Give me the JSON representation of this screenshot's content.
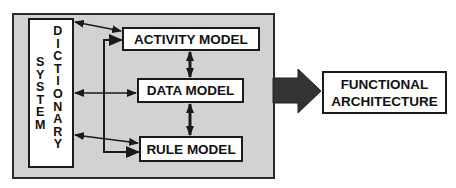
{
  "diagram": {
    "container": {
      "fill": "#d2d2d2",
      "border": "#2a2a2a"
    },
    "system_dictionary": {
      "word1": [
        "S",
        "Y",
        "S",
        "T",
        "E",
        "M"
      ],
      "word2": [
        "D",
        "I",
        "C",
        "T",
        "I",
        "O",
        "N",
        "A",
        "R",
        "Y"
      ],
      "label": "SYSTEM DICTIONARY"
    },
    "models": {
      "activity": "ACTIVITY MODEL",
      "data": "DATA MODEL",
      "rule": "RULE MODEL"
    },
    "output": {
      "line1": "FUNCTIONAL",
      "line2": "ARCHITECTURE"
    },
    "connections": [
      {
        "from": "system_dictionary",
        "to": "activity_model",
        "type": "bidirectional"
      },
      {
        "from": "system_dictionary",
        "to": "data_model",
        "type": "bidirectional"
      },
      {
        "from": "system_dictionary",
        "to": "rule_model",
        "type": "bidirectional"
      },
      {
        "from": "bracket",
        "to": "activity_model",
        "type": "directed"
      },
      {
        "from": "bracket",
        "to": "rule_model",
        "type": "directed"
      },
      {
        "from": "activity_model",
        "to": "data_model",
        "type": "bidirectional"
      },
      {
        "from": "data_model",
        "to": "rule_model",
        "type": "bidirectional"
      },
      {
        "from": "container",
        "to": "functional_architecture",
        "type": "block-arrow"
      }
    ],
    "colors": {
      "line": "#1a1a1a",
      "block_arrow": "#333333",
      "box_fill": "#ffffff"
    }
  }
}
